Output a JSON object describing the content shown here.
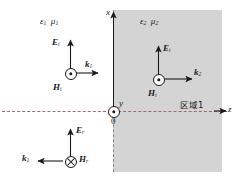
{
  "figure": {
    "background_color": "#ffffff",
    "region2_fill": "#d4d4d4",
    "axis_color": "#1a1a1a",
    "dash_boundary_color": "#8a8a8a",
    "dashdot_axis_color": "#a06b6b"
  },
  "axes": {
    "x_label": "x",
    "y_label": "y",
    "z_label": "z",
    "origin_label": "0"
  },
  "media": {
    "region1": {
      "permittivity": "ε",
      "permittivity_sub": "1",
      "permeability": "μ",
      "permeability_sub": "1"
    },
    "region2": {
      "permittivity": "ε",
      "permittivity_sub": "2",
      "permeability": "μ",
      "permeability_sub": "2"
    }
  },
  "region_tag": {
    "text": "区域1"
  },
  "incident": {
    "e_name": "E",
    "e_sub": "i",
    "h_name": "H",
    "h_sub": "i",
    "k_name": "k",
    "k_sub": "1",
    "h_symbol": "dot-out-of-page"
  },
  "reflected": {
    "e_name": "E",
    "e_sub": "r",
    "h_name": "H",
    "h_sub": "r",
    "k_name": "k",
    "k_sub": "1",
    "h_symbol": "cross-into-page"
  },
  "transmitted": {
    "e_name": "E",
    "e_sub": "t",
    "h_name": "H",
    "h_sub": "t",
    "k_name": "k",
    "k_sub": "2",
    "h_symbol": "dot-out-of-page"
  },
  "origin_marker": {
    "symbol": "dot-out-of-page"
  }
}
